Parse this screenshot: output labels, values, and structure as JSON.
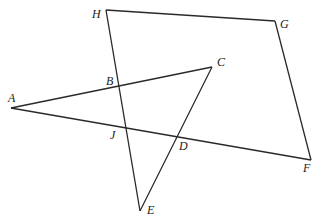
{
  "diagram": {
    "type": "geometry",
    "points": {
      "A": {
        "x": 11,
        "y": 108,
        "label": "A",
        "lx": 8,
        "ly": 102
      },
      "B": {
        "x": 119,
        "y": 87,
        "label": "B",
        "lx": 106,
        "ly": 85
      },
      "C": {
        "x": 212,
        "y": 67,
        "label": "C",
        "lx": 217,
        "ly": 66
      },
      "D": {
        "x": 177,
        "y": 137,
        "label": "D",
        "lx": 179,
        "ly": 150
      },
      "E": {
        "x": 140,
        "y": 211,
        "label": "E",
        "lx": 147,
        "ly": 214
      },
      "F": {
        "x": 311,
        "y": 160,
        "label": "F",
        "lx": 303,
        "ly": 172
      },
      "G": {
        "x": 275,
        "y": 21,
        "label": "G",
        "lx": 280,
        "ly": 28
      },
      "H": {
        "x": 106,
        "y": 10,
        "label": "H",
        "lx": 92,
        "ly": 18
      },
      "J": {
        "x": 125,
        "y": 127,
        "label": "J",
        "lx": 110,
        "ly": 139
      }
    },
    "segments": [
      [
        "H",
        "G"
      ],
      [
        "G",
        "F"
      ],
      [
        "A",
        "F"
      ],
      [
        "A",
        "C"
      ],
      [
        "C",
        "E"
      ],
      [
        "H",
        "E"
      ]
    ]
  }
}
